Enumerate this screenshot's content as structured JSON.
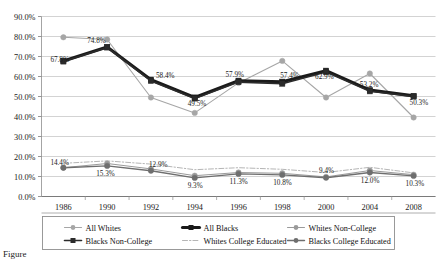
{
  "figure": {
    "caption": "Figure"
  },
  "chart_data": {
    "type": "line",
    "title": "",
    "xlabel": "",
    "ylabel": "",
    "categories": [
      "1986",
      "1990",
      "1992",
      "1994",
      "1996",
      "1998",
      "2000",
      "2004",
      "2008"
    ],
    "ylim": [
      0,
      90
    ],
    "ytick_values": [
      0,
      10,
      20,
      30,
      40,
      50,
      60,
      70,
      80,
      90
    ],
    "ytick_labels": [
      "0.0%",
      "10.0%",
      "20.0%",
      "30.0%",
      "40.0%",
      "50.0%",
      "60.0%",
      "70.0%",
      "80.0%",
      "90.0%"
    ],
    "grid": true,
    "legend_position": "bottom",
    "series": [
      {
        "name": "All Whites",
        "color": "#a6a6a6",
        "style": "solid",
        "width": 1.1,
        "marker": "circle",
        "values": [
          79.6,
          78.5,
          49.5,
          41.8,
          56.8,
          67.8,
          49.5,
          61.5,
          39.5
        ]
      },
      {
        "name": "All Blacks",
        "color": "#1a1a1a",
        "style": "solid",
        "width": 3.1,
        "marker": "square",
        "values": [
          67.8,
          74.8,
          58.4,
          49.5,
          57.9,
          57.4,
          62.9,
          53.2,
          50.3
        ]
      },
      {
        "name": "Whites Non-College",
        "color": "#9a9a9a",
        "style": "solid",
        "width": 1.0,
        "marker": "circle",
        "values": [
          14.4,
          16.5,
          13.8,
          10.4,
          12.0,
          11.6,
          9.8,
          13.0,
          10.9
        ]
      },
      {
        "name": "Blacks Non-College",
        "color": "#2b2b2b",
        "style": "solid",
        "width": 1.6,
        "marker": "square",
        "values": [
          67.5,
          74.5,
          57.8,
          49.0,
          57.2,
          56.4,
          62.2,
          52.6,
          50.0
        ]
      },
      {
        "name": "Whites College Educated",
        "color": "#b5b5b5",
        "style": "dashdot",
        "width": 1.0,
        "marker": "none",
        "values": [
          16.6,
          17.8,
          16.2,
          13.4,
          14.4,
          13.6,
          12.0,
          14.6,
          11.8
        ]
      },
      {
        "name": "Blacks College Educated",
        "color": "#6e6e6e",
        "style": "solid",
        "width": 1.4,
        "marker": "circle",
        "values": [
          14.4,
          15.3,
          12.9,
          9.3,
          11.3,
          10.8,
          9.4,
          12.0,
          10.3
        ]
      }
    ],
    "annotations": [
      {
        "text": "67.8%",
        "x": 0,
        "y": 67.8,
        "dx": -13,
        "dy": 1,
        "anchor": "start"
      },
      {
        "text": "74.8%",
        "x": 1,
        "y": 74.8,
        "dx": -20,
        "dy": -4,
        "anchor": "start"
      },
      {
        "text": "58.4%",
        "x": 2,
        "y": 58.4,
        "dx": 5,
        "dy": -2,
        "anchor": "start"
      },
      {
        "text": "49.5%",
        "x": 3,
        "y": 49.5,
        "dx": -7,
        "dy": 8,
        "anchor": "start"
      },
      {
        "text": "57.9%",
        "x": 4,
        "y": 57.9,
        "dx": -13,
        "dy": -4,
        "anchor": "start"
      },
      {
        "text": "57.4%",
        "x": 5,
        "y": 57.4,
        "dx": -2,
        "dy": -4,
        "anchor": "start"
      },
      {
        "text": "62.9%",
        "x": 6,
        "y": 62.9,
        "dx": -11,
        "dy": 8,
        "anchor": "start"
      },
      {
        "text": "53.2%",
        "x": 7,
        "y": 53.2,
        "dx": -10,
        "dy": -3,
        "anchor": "start"
      },
      {
        "text": "50.3%",
        "x": 8,
        "y": 50.3,
        "dx": -4,
        "dy": 9,
        "anchor": "start"
      },
      {
        "text": "14.4%",
        "x": 0,
        "y": 14.4,
        "dx": -13,
        "dy": -3,
        "anchor": "start"
      },
      {
        "text": "15.3%",
        "x": 1,
        "y": 15.3,
        "dx": -11,
        "dy": 10,
        "anchor": "start"
      },
      {
        "text": "12.9%",
        "x": 2,
        "y": 12.9,
        "dx": -2,
        "dy": -4,
        "anchor": "start"
      },
      {
        "text": "9.3%",
        "x": 3,
        "y": 9.3,
        "dx": -7,
        "dy": 10,
        "anchor": "start"
      },
      {
        "text": "11.3%",
        "x": 4,
        "y": 11.3,
        "dx": -9,
        "dy": 10,
        "anchor": "start"
      },
      {
        "text": "10.8%",
        "x": 5,
        "y": 10.8,
        "dx": -9,
        "dy": 10,
        "anchor": "start"
      },
      {
        "text": "9.4%",
        "x": 6,
        "y": 9.4,
        "dx": -7,
        "dy": -5,
        "anchor": "start"
      },
      {
        "text": "12.0%",
        "x": 7,
        "y": 12.0,
        "dx": -9,
        "dy": 10,
        "anchor": "start"
      },
      {
        "text": "10.3%",
        "x": 8,
        "y": 10.3,
        "dx": -8,
        "dy": 10,
        "anchor": "start"
      }
    ],
    "legend_entries": [
      {
        "name": "All Whites",
        "color": "#a6a6a6",
        "style": "solid",
        "marker": "circle",
        "width": 1.1
      },
      {
        "name": "All Blacks",
        "color": "#1a1a1a",
        "style": "solid",
        "marker": "square",
        "width": 3.1
      },
      {
        "name": "Whites Non-College",
        "color": "#9a9a9a",
        "style": "solid",
        "marker": "circle",
        "width": 1.0
      },
      {
        "name": "Blacks Non-College",
        "color": "#2b2b2b",
        "style": "solid",
        "marker": "square",
        "width": 1.6
      },
      {
        "name": "Whites College Educated",
        "color": "#b5b5b5",
        "style": "dashdot",
        "marker": "none",
        "width": 1.0
      },
      {
        "name": "Blacks College Educated",
        "color": "#6e6e6e",
        "style": "solid",
        "marker": "circle",
        "width": 1.4
      }
    ]
  }
}
